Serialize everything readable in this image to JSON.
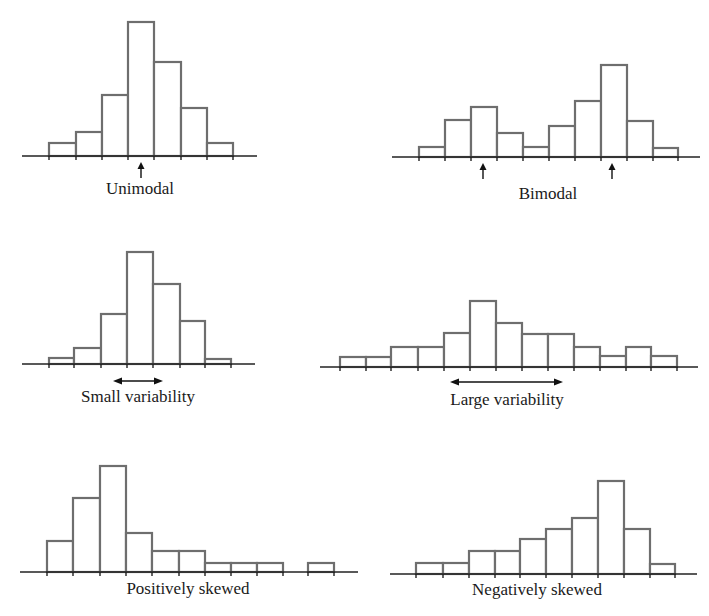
{
  "chart_data": [
    {
      "type": "bar",
      "title": "Unimodal",
      "annotation": "single mode arrow",
      "baseline_y": 156,
      "axis": [
        22,
        257
      ],
      "edges": [
        49,
        76,
        102,
        128,
        154,
        181,
        207,
        233
      ],
      "tops": [
        143,
        132,
        95,
        22,
        62,
        108,
        143
      ],
      "values": [
        1,
        2,
        5,
        10,
        7,
        4,
        1
      ],
      "arrows_up": [
        141
      ],
      "label_pos": [
        140,
        194
      ]
    },
    {
      "type": "bar",
      "title": "Bimodal",
      "annotation": "two mode arrows",
      "baseline_y": 157,
      "axis": [
        392,
        700
      ],
      "edges": [
        419,
        445,
        471,
        497,
        523,
        549,
        575,
        601,
        627,
        653,
        678
      ],
      "tops": [
        147,
        120,
        107,
        133,
        147,
        126,
        101,
        65,
        121,
        148
      ],
      "values": [
        1,
        3,
        4,
        2,
        1,
        3,
        5,
        8,
        3,
        1
      ],
      "arrows_up": [
        483,
        612
      ],
      "label_pos": [
        548,
        199
      ]
    },
    {
      "type": "bar",
      "title": "Small variability",
      "annotation": "short double arrow indicating spread",
      "baseline_y": 364,
      "axis": [
        22,
        255
      ],
      "edges": [
        49,
        74,
        101,
        127,
        153,
        180,
        205,
        231
      ],
      "tops": [
        358,
        348,
        314,
        252,
        284,
        321,
        359
      ],
      "values": [
        1,
        2,
        5,
        10,
        7,
        4,
        1
      ],
      "double_arrow": [
        113,
        163,
        381
      ],
      "label_pos": [
        138,
        402
      ]
    },
    {
      "type": "bar",
      "title": "Large variability",
      "annotation": "long double arrow indicating spread",
      "baseline_y": 367,
      "axis": [
        320,
        698
      ],
      "edges": [
        340,
        366,
        391,
        418,
        444,
        470,
        496,
        522,
        548,
        574,
        600,
        626,
        651,
        677
      ],
      "tops": [
        357,
        357,
        347,
        347,
        333,
        301,
        323,
        334,
        334,
        347,
        356,
        347,
        356
      ],
      "values": [
        1,
        1,
        2,
        2,
        3,
        6,
        4,
        3,
        3,
        2,
        1,
        2,
        1
      ],
      "double_arrow": [
        450,
        563,
        382
      ],
      "label_pos": [
        507,
        405
      ]
    },
    {
      "type": "bar",
      "title": "Positively skewed",
      "annotation": "long right tail",
      "baseline_y": 572,
      "axis": [
        20,
        358
      ],
      "bars": [
        [
          47,
          73,
          541
        ],
        [
          73,
          100,
          498
        ],
        [
          100,
          126,
          466
        ],
        [
          126,
          152,
          533
        ],
        [
          152,
          179,
          551
        ],
        [
          179,
          205,
          551
        ],
        [
          205,
          231,
          563
        ],
        [
          231,
          257,
          563
        ],
        [
          257,
          283,
          563
        ],
        [
          308,
          334,
          563
        ]
      ],
      "ticks": [
        47,
        73,
        100,
        126,
        152,
        179,
        205,
        231,
        257,
        283,
        308,
        334
      ],
      "values": [
        3,
        7,
        10,
        4,
        2,
        2,
        1,
        1,
        1,
        0,
        1
      ],
      "label_pos": [
        188,
        594
      ]
    },
    {
      "type": "bar",
      "title": "Negatively skewed",
      "annotation": "long left tail",
      "baseline_y": 574,
      "axis": [
        390,
        697
      ],
      "edges": [
        416,
        443,
        469,
        495,
        520,
        546,
        572,
        598,
        624,
        650,
        675
      ],
      "tops": [
        563,
        563,
        551,
        551,
        539,
        529,
        518,
        481,
        529,
        564
      ],
      "values": [
        1,
        1,
        2,
        2,
        3,
        4,
        5,
        8,
        4,
        1
      ],
      "label_pos": [
        537,
        595
      ]
    }
  ],
  "labels": {
    "unimodal": "Unimodal",
    "bimodal": "Bimodal",
    "small": "Small variability",
    "large": "Large variability",
    "positive": "Positively skewed",
    "negative": "Negatively skewed"
  }
}
